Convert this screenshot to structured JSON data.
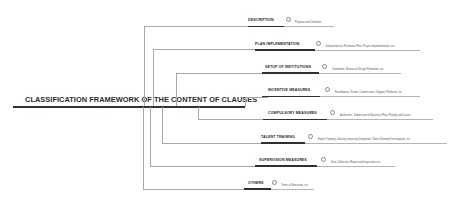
{
  "diagram": {
    "root": {
      "title": "CLASSIFICATION FRAMEWORK OF THE CONTENT OF CLAUSES"
    },
    "branches": [
      {
        "label": "DESCRIPTION",
        "detail": "Purpose and Definition"
      },
      {
        "label": "PLAN IMPLEMENTATION",
        "detail": "Comprehensive Promotion Plan, Project Implementation, etc."
      },
      {
        "label": "SETUP OF INSTITUTIONS",
        "detail": "Committee, Bureau of Design Promotion, etc."
      },
      {
        "label": "INCENTIVE MEASURES",
        "detail": "Foundations, Funds, Commissions, Support Platforms, etc."
      },
      {
        "label": "COMPULSORY MEASURES",
        "detail": "Authorities, Submission of Business Plan, Penalty and Issues"
      },
      {
        "label": "TALENT TRAINING",
        "detail": "Expert Training, Industry-university Integration, Talent Demand Investigation, etc."
      },
      {
        "label": "SUPERVISION MEASURES",
        "detail": "Data Collection, Report and Inspection, etc."
      },
      {
        "label": "OTHERS",
        "detail": "Terms of Execution, etc."
      }
    ],
    "colors": {
      "text": "#2a2a2a",
      "connector": "#a8a8a8",
      "underline": "#2f2f2f",
      "detail": "#555555"
    }
  }
}
